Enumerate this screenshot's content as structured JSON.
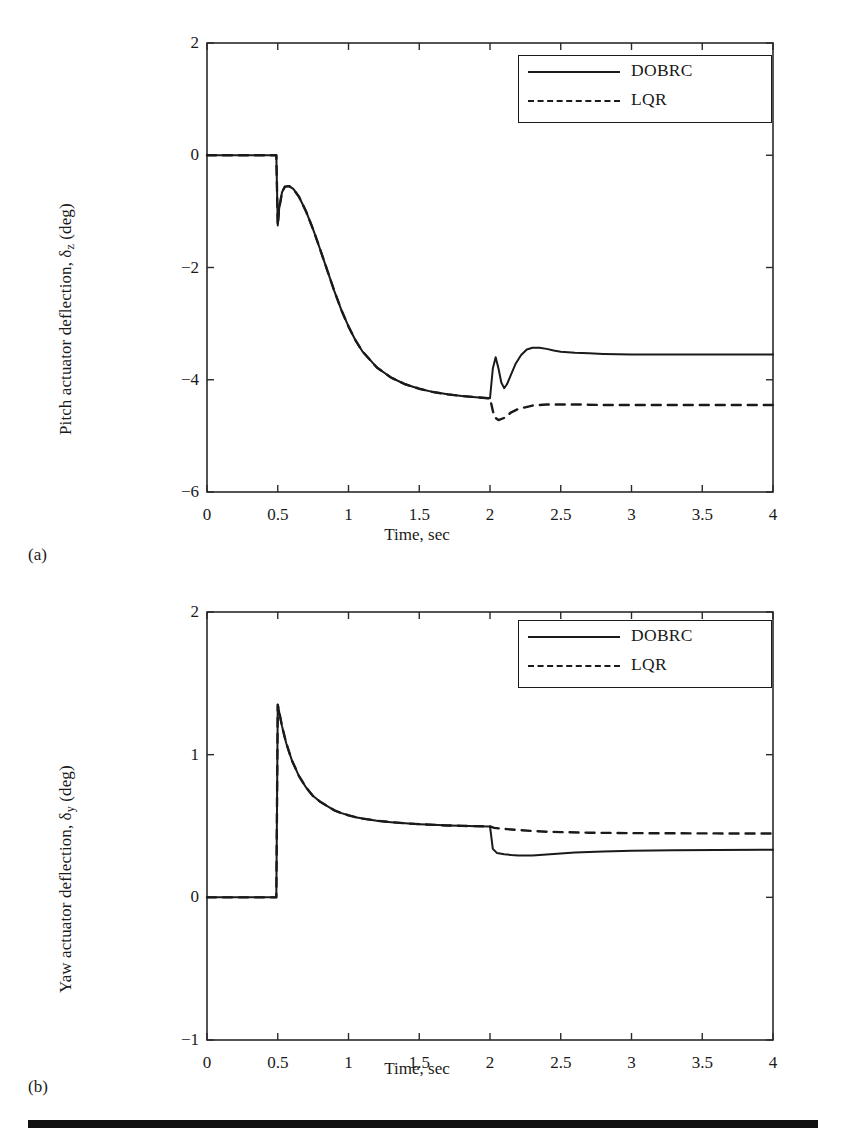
{
  "figure": {
    "panel_a_tag": "(a)",
    "panel_b_tag": "(b)",
    "line_color": "#1a1a1a",
    "background": "#ffffff"
  },
  "legend": {
    "entries": [
      {
        "label": "DOBRC",
        "style": "solid"
      },
      {
        "label": "LQR",
        "style": "dashed"
      }
    ]
  },
  "chart_data": [
    {
      "type": "line",
      "panel": "(a)",
      "title": "",
      "xlabel": "Time, sec",
      "ylabel": "Pitch actuator deflection, δz (deg)",
      "ylabel_base": "Pitch actuator deflection, δ",
      "ylabel_sub": "z",
      "ylabel_tail": " (deg)",
      "xlim": [
        0,
        4
      ],
      "ylim": [
        -6,
        2
      ],
      "xticks": [
        0,
        0.5,
        1,
        1.5,
        2,
        2.5,
        3,
        3.5,
        4
      ],
      "xtick_labels": [
        "0",
        "0.5",
        "1",
        "1.5",
        "2",
        "2.5",
        "3",
        "3.5",
        "4"
      ],
      "yticks": [
        -6,
        -4,
        -2,
        0,
        2
      ],
      "ytick_labels": [
        "−6",
        "−4",
        "−2",
        "0",
        "2"
      ],
      "grid": false,
      "legend_position": "top-right",
      "series": [
        {
          "name": "DOBRC",
          "style": "solid",
          "x": [
            0,
            0.1,
            0.2,
            0.3,
            0.4,
            0.49,
            0.5,
            0.51,
            0.53,
            0.55,
            0.58,
            0.61,
            0.65,
            0.7,
            0.75,
            0.8,
            0.85,
            0.9,
            0.95,
            1.0,
            1.05,
            1.1,
            1.2,
            1.3,
            1.4,
            1.5,
            1.6,
            1.7,
            1.8,
            1.9,
            1.99,
            2.0,
            2.02,
            2.04,
            2.06,
            2.08,
            2.1,
            2.12,
            2.15,
            2.18,
            2.22,
            2.26,
            2.3,
            2.35,
            2.4,
            2.45,
            2.5,
            2.6,
            2.7,
            2.8,
            3.0,
            3.2,
            3.5,
            3.8,
            4.0
          ],
          "y": [
            0,
            0,
            0,
            0,
            0,
            0,
            -1.25,
            -0.95,
            -0.66,
            -0.56,
            -0.55,
            -0.6,
            -0.74,
            -1.0,
            -1.32,
            -1.68,
            -2.05,
            -2.42,
            -2.76,
            -3.05,
            -3.3,
            -3.5,
            -3.78,
            -3.96,
            -4.08,
            -4.16,
            -4.22,
            -4.26,
            -4.29,
            -4.31,
            -4.33,
            -4.33,
            -3.8,
            -3.6,
            -3.8,
            -4.05,
            -4.15,
            -4.08,
            -3.9,
            -3.72,
            -3.56,
            -3.46,
            -3.43,
            -3.43,
            -3.45,
            -3.48,
            -3.5,
            -3.52,
            -3.53,
            -3.54,
            -3.55,
            -3.55,
            -3.55,
            -3.55,
            -3.55
          ]
        },
        {
          "name": "LQR",
          "style": "dashed",
          "x": [
            0,
            0.1,
            0.2,
            0.3,
            0.4,
            0.49,
            0.5,
            0.51,
            0.53,
            0.55,
            0.58,
            0.61,
            0.65,
            0.7,
            0.75,
            0.8,
            0.85,
            0.9,
            0.95,
            1.0,
            1.05,
            1.1,
            1.2,
            1.3,
            1.4,
            1.5,
            1.6,
            1.7,
            1.8,
            1.9,
            1.99,
            2.0,
            2.03,
            2.06,
            2.1,
            2.15,
            2.2,
            2.3,
            2.4,
            2.5,
            2.6,
            2.8,
            3.0,
            3.2,
            3.5,
            3.8,
            4.0
          ],
          "y": [
            0,
            0,
            0,
            0,
            0,
            0,
            -1.25,
            -0.95,
            -0.66,
            -0.56,
            -0.55,
            -0.6,
            -0.74,
            -1.0,
            -1.32,
            -1.68,
            -2.05,
            -2.42,
            -2.76,
            -3.05,
            -3.3,
            -3.5,
            -3.78,
            -3.96,
            -4.08,
            -4.16,
            -4.22,
            -4.26,
            -4.29,
            -4.31,
            -4.33,
            -4.33,
            -4.66,
            -4.72,
            -4.68,
            -4.58,
            -4.52,
            -4.46,
            -4.44,
            -4.44,
            -4.44,
            -4.45,
            -4.45,
            -4.45,
            -4.45,
            -4.45,
            -4.45
          ]
        }
      ],
      "annotations": [
        {
          "text": "step disturbance at t = 0.5 s"
        },
        {
          "text": "second disturbance at t = 2 s"
        }
      ]
    },
    {
      "type": "line",
      "panel": "(b)",
      "title": "",
      "xlabel": "Time, sec",
      "ylabel": "Yaw actuator deflection, δy (deg)",
      "ylabel_base": "Yaw actuator deflection, δ",
      "ylabel_sub": "y",
      "ylabel_tail": " (deg)",
      "xlim": [
        0,
        4
      ],
      "ylim": [
        -1,
        2
      ],
      "xticks": [
        0,
        0.5,
        1,
        1.5,
        2,
        2.5,
        3,
        3.5,
        4
      ],
      "xtick_labels": [
        "0",
        "0.5",
        "1",
        "1.5",
        "2",
        "2.5",
        "3",
        "3.5",
        "4"
      ],
      "yticks": [
        -1,
        0,
        1,
        2
      ],
      "ytick_labels": [
        "−1",
        "0",
        "1",
        "2"
      ],
      "grid": false,
      "legend_position": "top-right",
      "series": [
        {
          "name": "DOBRC",
          "style": "solid",
          "x": [
            0,
            0.1,
            0.2,
            0.3,
            0.4,
            0.49,
            0.5,
            0.53,
            0.56,
            0.6,
            0.65,
            0.7,
            0.75,
            0.8,
            0.85,
            0.9,
            0.95,
            1.0,
            1.05,
            1.1,
            1.2,
            1.3,
            1.4,
            1.5,
            1.6,
            1.7,
            1.8,
            1.9,
            1.99,
            2.0,
            2.02,
            2.05,
            2.1,
            2.15,
            2.2,
            2.3,
            2.4,
            2.5,
            2.6,
            2.8,
            3.0,
            3.3,
            3.6,
            4.0
          ],
          "y": [
            0,
            0,
            0,
            0,
            0,
            0,
            1.35,
            1.2,
            1.08,
            0.96,
            0.85,
            0.77,
            0.71,
            0.67,
            0.64,
            0.61,
            0.59,
            0.575,
            0.562,
            0.552,
            0.537,
            0.527,
            0.519,
            0.513,
            0.508,
            0.504,
            0.501,
            0.499,
            0.497,
            0.497,
            0.34,
            0.31,
            0.302,
            0.297,
            0.294,
            0.293,
            0.3,
            0.308,
            0.315,
            0.322,
            0.326,
            0.33,
            0.332,
            0.334
          ]
        },
        {
          "name": "LQR",
          "style": "dashed",
          "x": [
            0,
            0.1,
            0.2,
            0.3,
            0.4,
            0.49,
            0.5,
            0.53,
            0.56,
            0.6,
            0.65,
            0.7,
            0.75,
            0.8,
            0.85,
            0.9,
            0.95,
            1.0,
            1.05,
            1.1,
            1.2,
            1.3,
            1.4,
            1.5,
            1.6,
            1.7,
            1.8,
            1.9,
            1.99,
            2.0,
            2.03,
            2.07,
            2.12,
            2.2,
            2.3,
            2.4,
            2.5,
            2.7,
            3.0,
            3.3,
            3.6,
            4.0
          ],
          "y": [
            0,
            0,
            0,
            0,
            0,
            0,
            1.35,
            1.2,
            1.08,
            0.96,
            0.85,
            0.77,
            0.71,
            0.67,
            0.64,
            0.61,
            0.59,
            0.575,
            0.562,
            0.552,
            0.537,
            0.527,
            0.519,
            0.513,
            0.508,
            0.504,
            0.501,
            0.499,
            0.497,
            0.497,
            0.487,
            0.482,
            0.478,
            0.472,
            0.465,
            0.46,
            0.457,
            0.453,
            0.45,
            0.449,
            0.448,
            0.447
          ]
        }
      ],
      "annotations": [
        {
          "text": "step disturbance at t = 0.5 s"
        },
        {
          "text": "second disturbance at t = 2 s"
        }
      ]
    }
  ]
}
